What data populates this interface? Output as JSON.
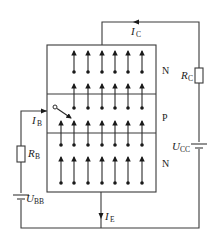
{
  "diagram": {
    "type": "transistor-carrier-flow",
    "regions": [
      {
        "label": "N",
        "role": "collector"
      },
      {
        "label": "P",
        "role": "base"
      },
      {
        "label": "N",
        "role": "emitter"
      }
    ],
    "currents": {
      "collector": {
        "main": "I",
        "sub": "C"
      },
      "base": {
        "main": "I",
        "sub": "B"
      },
      "emitter": {
        "main": "I",
        "sub": "E"
      }
    },
    "components": {
      "rc": {
        "main": "R",
        "sub": "C"
      },
      "rb": {
        "main": "R",
        "sub": "B"
      },
      "ucc": {
        "main": "U",
        "sub": "CC"
      },
      "ubb": {
        "main": "U",
        "sub": "BB"
      }
    },
    "colors": {
      "line": "#3a3a3a",
      "background": "#ffffff"
    }
  }
}
